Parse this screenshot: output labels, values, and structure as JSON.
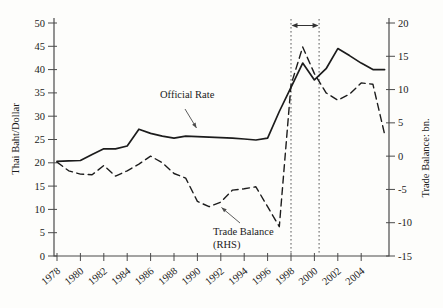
{
  "figure": {
    "background": "#fdfdfb",
    "line_color": "#1c1c1c",
    "axis_color": "#4b4b4b",
    "marker_color": "#5a5a5a",
    "left_axis": {
      "label": "Thai Baht/Dollar",
      "ticks": [
        0,
        5,
        10,
        15,
        20,
        25,
        30,
        35,
        40,
        45,
        50
      ]
    },
    "right_axis": {
      "label": "Trade Balance: bn.",
      "ticks": [
        -15,
        -10,
        -5,
        0,
        5,
        10,
        15,
        20
      ]
    },
    "x_axis": {
      "ticks": [
        1978,
        1980,
        1982,
        1984,
        1986,
        1988,
        1990,
        1992,
        1994,
        1996,
        1998,
        2000,
        2002,
        2004
      ]
    },
    "annotations": {
      "official_rate": "Official Rate",
      "trade_balance_line1": "Trade Balance",
      "trade_balance_line2": "(RHS)"
    },
    "period_marker": {
      "from_year": 1998,
      "to_year": 2000.4
    }
  },
  "chart_data": {
    "type": "line",
    "title": "",
    "xlabel": "",
    "ylabel_left": "Thai Baht/Dollar",
    "ylabel_right": "Trade Balance: bn.",
    "ylim_left": [
      0,
      50
    ],
    "ylim_right": [
      -15,
      20
    ],
    "xlim": [
      1978,
      2006.5
    ],
    "grid": false,
    "x": [
      1978,
      1979,
      1980,
      1981,
      1982,
      1983,
      1984,
      1985,
      1986,
      1987,
      1988,
      1989,
      1990,
      1991,
      1992,
      1993,
      1994,
      1995,
      1996,
      1997,
      1998,
      1999,
      2000,
      2001,
      2002,
      2003,
      2004,
      2005,
      2006
    ],
    "series": [
      {
        "name": "Official Rate",
        "axis": "left",
        "line_style": "solid",
        "values": [
          20.3,
          20.4,
          20.5,
          21.8,
          23.0,
          23.0,
          23.6,
          27.2,
          26.3,
          25.7,
          25.3,
          25.7,
          25.6,
          25.5,
          25.4,
          25.3,
          25.1,
          24.9,
          25.3,
          31.0,
          36.2,
          41.4,
          37.8,
          40.2,
          44.5,
          43.0,
          41.4,
          40.0,
          40.0
        ]
      },
      {
        "name": "Trade Balance (RHS)",
        "axis": "right",
        "line_style": "dashed",
        "values": [
          -0.9,
          -2.2,
          -2.7,
          -2.8,
          -1.4,
          -3.0,
          -2.2,
          -1.2,
          0.0,
          -1.0,
          -2.6,
          -3.3,
          -6.8,
          -7.6,
          -6.9,
          -5.1,
          -4.9,
          -4.6,
          -7.6,
          -10.6,
          10.7,
          16.4,
          12.4,
          9.5,
          8.4,
          9.3,
          11.0,
          10.8,
          3.3
        ]
      }
    ]
  }
}
